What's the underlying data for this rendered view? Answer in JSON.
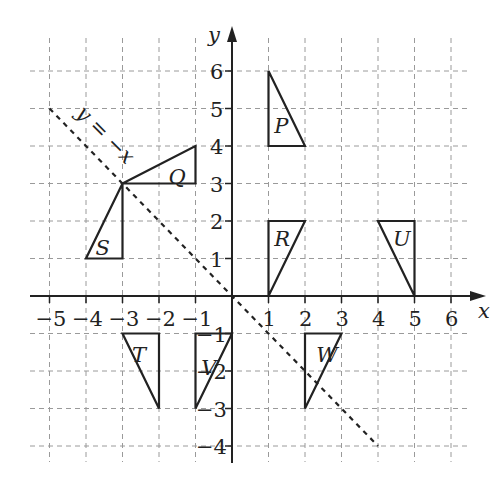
{
  "diagram": {
    "title": "",
    "axes": {
      "x_label": "x",
      "y_label": "y",
      "x_ticks": [
        -5,
        -4,
        -3,
        -2,
        -1,
        1,
        2,
        3,
        4,
        5,
        6
      ],
      "y_ticks": [
        -4,
        -3,
        -2,
        -1,
        1,
        2,
        3,
        4,
        5,
        6
      ],
      "x_range": [
        -5.5,
        6.5
      ],
      "y_range": [
        -4.5,
        7
      ],
      "grid": true,
      "grid_style": "dashed"
    },
    "mirror_line": {
      "label": "y = −x",
      "from": [
        -5,
        5
      ],
      "to": [
        4,
        -4
      ],
      "style": "dashed"
    },
    "shapes": [
      {
        "label": "P",
        "vertices": [
          [
            1,
            6
          ],
          [
            1,
            4
          ],
          [
            2,
            4
          ]
        ],
        "label_pos": [
          1.35,
          4.55
        ]
      },
      {
        "label": "Q",
        "vertices": [
          [
            -3,
            3
          ],
          [
            -1,
            4
          ],
          [
            -1,
            3
          ]
        ],
        "label_pos": [
          -1.55,
          3.2
        ]
      },
      {
        "label": "R",
        "vertices": [
          [
            1,
            2
          ],
          [
            2,
            2
          ],
          [
            1,
            0
          ]
        ],
        "label_pos": [
          1.35,
          1.55
        ]
      },
      {
        "label": "S",
        "vertices": [
          [
            -3,
            3
          ],
          [
            -4,
            1
          ],
          [
            -3,
            1
          ]
        ],
        "label_pos": [
          -3.55,
          1.3
        ]
      },
      {
        "label": "T",
        "vertices": [
          [
            -3,
            -1
          ],
          [
            -2,
            -1
          ],
          [
            -2,
            -3
          ]
        ],
        "label_pos": [
          -2.55,
          -1.55
        ]
      },
      {
        "label": "U",
        "vertices": [
          [
            4,
            2
          ],
          [
            5,
            2
          ],
          [
            5,
            0
          ]
        ],
        "label_pos": [
          4.6,
          1.55
        ]
      },
      {
        "label": "V",
        "vertices": [
          [
            -1,
            -1
          ],
          [
            0,
            -1
          ],
          [
            -1,
            -3
          ]
        ],
        "label_pos": [
          -0.65,
          -1.9
        ]
      },
      {
        "label": "W",
        "vertices": [
          [
            2,
            -1
          ],
          [
            3,
            -1
          ],
          [
            2,
            -3
          ]
        ],
        "label_pos": [
          2.5,
          -1.55
        ]
      }
    ],
    "colors": {
      "axis": "#222222",
      "grid": "#9a9a9a",
      "shape_stroke": "#222222",
      "mirror_line": "#222222",
      "background": "#ffffff"
    }
  }
}
